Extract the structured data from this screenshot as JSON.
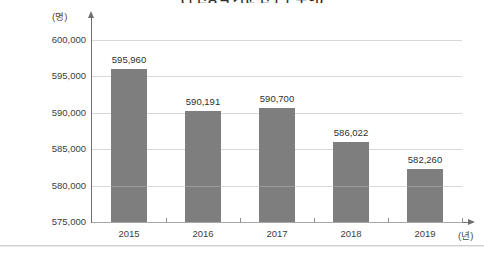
{
  "chart_data": {
    "type": "bar",
    "title": "(주민등록 기준 인구수 추이)",
    "title_clipped": true,
    "xlabel": "(년)",
    "ylabel": "(명)",
    "categories": [
      "2015",
      "2016",
      "2017",
      "2018",
      "2019"
    ],
    "values": [
      595960,
      590191,
      590700,
      586022,
      582260
    ],
    "value_labels": [
      "595,960",
      "590,191",
      "590,700",
      "586,022",
      "582,260"
    ],
    "ylim": [
      575000,
      600000
    ],
    "ytick_values": [
      600000,
      595000,
      590000,
      585000,
      580000,
      575000
    ],
    "ytick_labels": [
      "600,000",
      "595,000",
      "590,000",
      "585,000",
      "580,000",
      "575,000"
    ],
    "ytick_step": 5000,
    "grid": true,
    "grid_axis": "y",
    "legend": null,
    "legend_position": "none",
    "bar_color": "#7e7e7e",
    "grid_color": "#d8d8d8",
    "axis_color": "#6f6f6f",
    "background_color": "#ffffff",
    "bar_seam_value": 580000,
    "y_axis_arrow": true,
    "x_axis_arrow": true
  }
}
